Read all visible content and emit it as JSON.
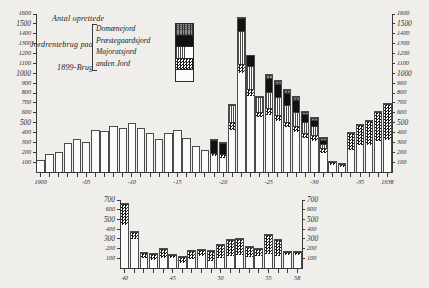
{
  "figure": {
    "annotations": [
      {
        "text": "Antal oprettede",
        "x": 52,
        "y": 18
      },
      {
        "text": "Jordrentebrug paa",
        "x": 30,
        "y": 43
      },
      {
        "text": "1899-Brug",
        "x": 57,
        "y": 66
      }
    ]
  },
  "legend": {
    "items": [
      {
        "label": "Domænejord",
        "pattern": "p-dom"
      },
      {
        "label": "Præstegaardsjord",
        "pattern": "p-prst"
      },
      {
        "label": "Majoratsjord",
        "pattern": "p-maj"
      },
      {
        "label": "anden Jord",
        "pattern": "p-and"
      },
      {
        "label": "1899-Brug",
        "pattern": "p-base"
      }
    ]
  },
  "chart_data": [
    {
      "id": "upper",
      "type": "bar",
      "stacked": true,
      "title": "Antal oprettede Jordrentebrug paa 1899-Brug",
      "xlabel": "",
      "ylabel": "",
      "ylim": [
        0,
        1600
      ],
      "yticks": [
        100,
        200,
        300,
        400,
        500,
        600,
        700,
        800,
        900,
        1000,
        1100,
        1200,
        1300,
        1400,
        1500,
        1600
      ],
      "ytick_labels": [
        "100",
        "200",
        "300",
        "400",
        "500",
        "600",
        "700",
        "800",
        "900",
        "1000",
        "1100",
        "1200",
        "1300",
        "1400",
        "1500",
        "1600"
      ],
      "ytick_major": [
        500,
        1000,
        1500
      ],
      "y_axis_right": true,
      "grid": false,
      "legend_position": "upper-left",
      "x": [
        1900,
        1901,
        1902,
        1903,
        1904,
        1905,
        1906,
        1907,
        1908,
        1909,
        1910,
        1911,
        1912,
        1913,
        1914,
        1915,
        1916,
        1917,
        1918,
        1919,
        1920,
        1921,
        1922,
        1923,
        1924,
        1925,
        1926,
        1927,
        1928,
        1929,
        1930,
        1931,
        1932,
        1933,
        1934,
        1935,
        1936,
        1937,
        1938
      ],
      "xtick_positions": [
        1900,
        1905,
        1910,
        1915,
        1920,
        1925,
        1930,
        1935,
        1938
      ],
      "xtick_labels": [
        "1900",
        "-05",
        "-10",
        "-15",
        "-20",
        "-25",
        "-30",
        "-35",
        "1938"
      ],
      "series": [
        {
          "name": "1899-Brug",
          "pattern": "p-base",
          "values": [
            120,
            180,
            200,
            290,
            330,
            300,
            430,
            420,
            470,
            450,
            500,
            450,
            400,
            330,
            400,
            430,
            340,
            260,
            220,
            170,
            150,
            430,
            1010,
            780,
            560,
            580,
            520,
            460,
            410,
            350,
            320,
            200,
            80,
            60,
            230,
            280,
            280,
            320,
            330
          ]
        },
        {
          "name": "anden Jord",
          "pattern": "p-and",
          "values": [
            0,
            0,
            0,
            0,
            0,
            0,
            0,
            0,
            0,
            0,
            0,
            0,
            0,
            0,
            0,
            0,
            0,
            0,
            0,
            30,
            40,
            80,
            90,
            70,
            60,
            70,
            60,
            50,
            60,
            50,
            60,
            50,
            30,
            30,
            180,
            210,
            250,
            300,
            370
          ]
        },
        {
          "name": "Majoratsjord",
          "pattern": "p-maj",
          "values": [
            0,
            0,
            0,
            0,
            0,
            0,
            0,
            0,
            0,
            0,
            0,
            0,
            0,
            0,
            0,
            0,
            0,
            0,
            0,
            0,
            0,
            180,
            340,
            230,
            150,
            170,
            190,
            180,
            150,
            120,
            90,
            40,
            0,
            0,
            0,
            0,
            0,
            0,
            0
          ]
        },
        {
          "name": "Præstegaardsjord",
          "pattern": "p-prst",
          "values": [
            0,
            0,
            0,
            0,
            0,
            0,
            0,
            0,
            0,
            0,
            0,
            0,
            0,
            0,
            0,
            0,
            0,
            0,
            0,
            130,
            110,
            0,
            130,
            110,
            0,
            140,
            130,
            120,
            120,
            80,
            70,
            40,
            0,
            0,
            0,
            0,
            0,
            0,
            0
          ]
        },
        {
          "name": "Domænejord",
          "pattern": "p-dom",
          "values": [
            0,
            0,
            0,
            0,
            0,
            0,
            0,
            0,
            0,
            0,
            0,
            0,
            0,
            0,
            0,
            0,
            0,
            0,
            0,
            0,
            0,
            0,
            0,
            0,
            0,
            30,
            30,
            30,
            30,
            20,
            20,
            20,
            0,
            0,
            0,
            0,
            0,
            0,
            0
          ]
        }
      ]
    },
    {
      "id": "lower",
      "type": "bar",
      "stacked": true,
      "title": "",
      "xlabel": "",
      "ylabel": "",
      "ylim": [
        0,
        700
      ],
      "yticks": [
        100,
        200,
        300,
        400,
        500,
        600,
        700
      ],
      "ytick_labels": [
        "100",
        "200",
        "300",
        "400",
        "500",
        "600",
        "700"
      ],
      "ytick_major": [
        300,
        500,
        700
      ],
      "y_axis_right": true,
      "grid": false,
      "legend_position": "none",
      "x": [
        1940,
        1941,
        1942,
        1943,
        1944,
        1945,
        1946,
        1947,
        1948,
        1949,
        1950,
        1951,
        1952,
        1953,
        1954,
        1955,
        1956,
        1957,
        1958
      ],
      "xtick_positions": [
        1940,
        1945,
        1950,
        1955,
        1958
      ],
      "xtick_labels": [
        "40",
        "45",
        "50",
        "55",
        "58"
      ],
      "series": [
        {
          "name": "anden Jord",
          "pattern": "p-base",
          "values": [
            450,
            310,
            110,
            90,
            110,
            110,
            60,
            100,
            130,
            80,
            110,
            130,
            140,
            120,
            130,
            150,
            130,
            140,
            140
          ]
        },
        {
          "name": "Majoratsjord",
          "pattern": "p-and",
          "values": [
            220,
            70,
            50,
            60,
            100,
            30,
            60,
            90,
            70,
            110,
            140,
            170,
            170,
            110,
            80,
            200,
            170,
            40,
            40
          ]
        }
      ]
    }
  ]
}
